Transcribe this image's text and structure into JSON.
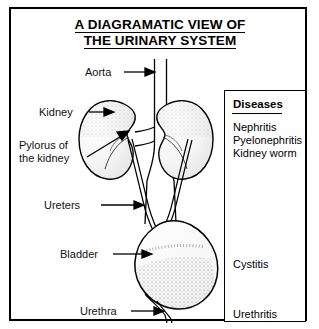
{
  "figure": {
    "title_line1": "A DIAGRAMATIC VIEW OF",
    "title_line2": "THE URINARY SYSTEM",
    "labels": {
      "aorta": "Aorta",
      "kidney": "Kidney",
      "pylorus_line1": "Pylorus of",
      "pylorus_line2": "the kidney",
      "ureters": "Ureters",
      "bladder": "Bladder",
      "urethra": "Urethra"
    },
    "diseases_panel": {
      "heading": "Diseases",
      "upper_items": [
        "Nephritis",
        "Pyelonephritis",
        "Kidney worm"
      ],
      "mid_item": "Cystitis",
      "lower_item": "Urethritis"
    },
    "colors": {
      "ink": "#000000",
      "paper": "#ffffff",
      "stipple": "#444444"
    }
  }
}
